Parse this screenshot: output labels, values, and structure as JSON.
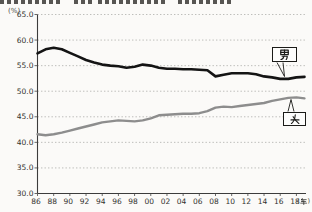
{
  "figure": {
    "unit_y": "(%)",
    "unit_x_open": "(",
    "unit_x_kanji": "年",
    "unit_x_close": ")",
    "male_label": "男",
    "female_label": "女"
  },
  "chart_data": {
    "type": "line",
    "title": "",
    "x": [
      1986,
      1987,
      1988,
      1989,
      1990,
      1991,
      1992,
      1993,
      1994,
      1995,
      1996,
      1997,
      1998,
      1999,
      2000,
      2001,
      2002,
      2003,
      2004,
      2005,
      2006,
      2007,
      2008,
      2009,
      2010,
      2011,
      2012,
      2013,
      2014,
      2015,
      2016,
      2017,
      2018,
      2019
    ],
    "x_tick_labels": [
      "86",
      "88",
      "90",
      "92",
      "94",
      "96",
      "98",
      "00",
      "02",
      "04",
      "06",
      "08",
      "10",
      "12",
      "14",
      "16",
      "18"
    ],
    "x_tick_years": [
      1986,
      1988,
      1990,
      1992,
      1994,
      1996,
      1998,
      2000,
      2002,
      2004,
      2006,
      2008,
      2010,
      2012,
      2014,
      2016,
      2018
    ],
    "xlabel": "年",
    "ylabel": "%",
    "ylim": [
      30.0,
      65.0
    ],
    "y_ticks": [
      65.0,
      60.0,
      55.0,
      50.0,
      45.0,
      40.0,
      35.0,
      30.0
    ],
    "grid": "dotted horizontal gridlines at each 5% from 35 to 65",
    "legend": "inline callout boxes pointing at line ends",
    "series": [
      {
        "name": "男",
        "color": "#141414",
        "values": [
          57.4,
          58.2,
          58.5,
          58.2,
          57.5,
          56.8,
          56.1,
          55.6,
          55.2,
          55.0,
          54.9,
          54.6,
          54.8,
          55.2,
          55.0,
          54.6,
          54.4,
          54.4,
          54.3,
          54.3,
          54.2,
          54.1,
          52.9,
          53.2,
          53.5,
          53.5,
          53.5,
          53.3,
          52.9,
          52.7,
          52.4,
          52.4,
          52.7,
          52.8
        ]
      },
      {
        "name": "女",
        "color": "#8d8d8d",
        "values": [
          41.6,
          41.4,
          41.6,
          41.9,
          42.3,
          42.7,
          43.1,
          43.5,
          43.9,
          44.1,
          44.3,
          44.2,
          44.1,
          44.3,
          44.7,
          45.3,
          45.4,
          45.5,
          45.6,
          45.6,
          45.7,
          46.1,
          46.8,
          47.0,
          46.9,
          47.1,
          47.3,
          47.5,
          47.7,
          48.1,
          48.4,
          48.7,
          48.8,
          48.6
        ]
      }
    ]
  }
}
